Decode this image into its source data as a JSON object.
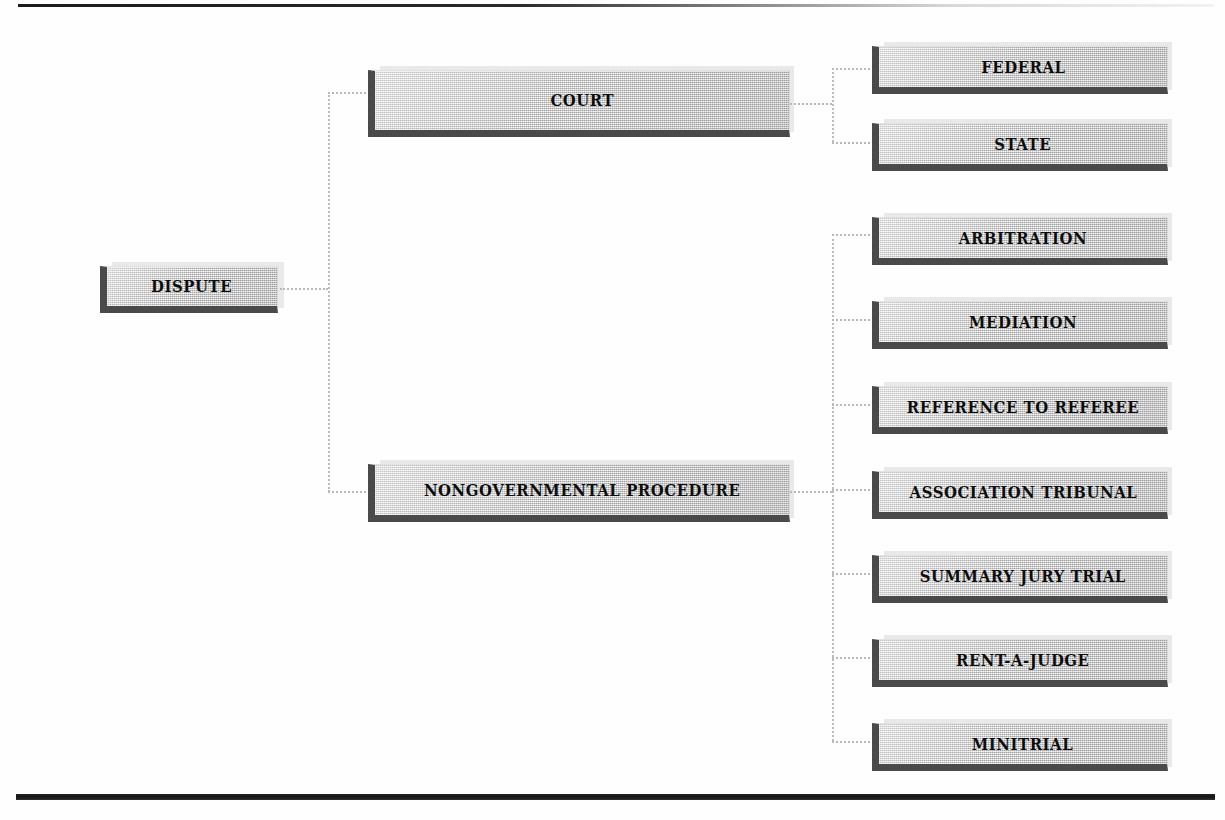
{
  "diagram": {
    "root": {
      "label": "DISPUTE"
    },
    "branches": [
      {
        "label": "COURT",
        "children": [
          {
            "label": "FEDERAL"
          },
          {
            "label": "STATE"
          }
        ]
      },
      {
        "label": "NONGOVERNMENTAL PROCEDURE",
        "children": [
          {
            "label": "ARBITRATION"
          },
          {
            "label": "MEDIATION"
          },
          {
            "label": "REFERENCE TO REFEREE"
          },
          {
            "label": "ASSOCIATION TRIBUNAL"
          },
          {
            "label": "SUMMARY JURY TRIAL"
          },
          {
            "label": "RENT-A-JUDGE"
          },
          {
            "label": "MINITRIAL"
          }
        ]
      }
    ]
  },
  "style": {
    "box_fill": "#c9c9c9",
    "box_shadow": "#4a4a4a",
    "text_color": "#0d0d0d",
    "connector_color": "#b9b9bd",
    "rule_color": "#141414",
    "page_background": "#fefefe"
  }
}
